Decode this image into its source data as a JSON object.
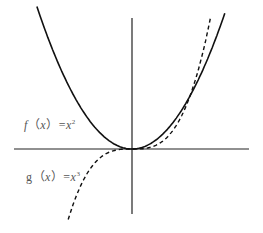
{
  "figure": {
    "labels": {
      "f": {
        "name": "f",
        "open": "（",
        "var": "x",
        "close": "）",
        "eq": "=",
        "base": "x",
        "exp": "2"
      },
      "g": {
        "name": "g",
        "open": "（",
        "var": "x",
        "close": "）",
        "eq": "=",
        "base": "x",
        "exp": "3"
      }
    },
    "colors": {
      "curve": "#111111",
      "axis": "#222222",
      "label": "#555555"
    }
  },
  "chart_data": {
    "type": "line",
    "title": "",
    "xlabel": "",
    "ylabel": "",
    "series": [
      {
        "name": "f(x)=x^2",
        "style": "solid",
        "x": [
          -1.6,
          -1.2,
          -0.8,
          -0.4,
          0,
          0.4,
          0.8,
          1.2,
          1.6
        ],
        "values": [
          2.56,
          1.44,
          0.64,
          0.16,
          0,
          0.16,
          0.64,
          1.44,
          2.56
        ]
      },
      {
        "name": "g(x)=x^3",
        "style": "dashed",
        "x": [
          -1.1,
          -0.8,
          -0.4,
          0,
          0.4,
          0.8,
          1.0,
          1.2,
          1.35
        ],
        "values": [
          -1.33,
          -0.51,
          -0.06,
          0,
          0.06,
          0.51,
          1.0,
          1.73,
          2.46
        ]
      }
    ],
    "annotations": [
      "f(x)=x²",
      "g(x)=x³"
    ],
    "grid": false,
    "axes": "cross at origin, no ticks"
  }
}
